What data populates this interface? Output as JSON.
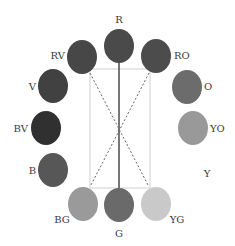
{
  "diagram": {
    "frame": {
      "x": 90,
      "y": 69,
      "w": 60,
      "h": 119,
      "stroke": "#d0d0d0"
    },
    "lines": [
      {
        "name": "solid-r-g",
        "x1": 119,
        "y1": 62,
        "x2": 119,
        "y2": 190,
        "style": "solid"
      },
      {
        "name": "dashed-rv-yg",
        "x1": 90,
        "y1": 73,
        "x2": 148,
        "y2": 185,
        "style": "dashed"
      },
      {
        "name": "dashed-ro-bg",
        "x1": 149,
        "y1": 73,
        "x2": 91,
        "y2": 185,
        "style": "dashed"
      }
    ],
    "nodes": [
      {
        "id": "R",
        "label": "R",
        "cx": 119,
        "cy": 46,
        "color": "#4a4a4a",
        "lx": 119,
        "ly": 23,
        "anchor": "middle"
      },
      {
        "id": "RV",
        "label": "RV",
        "cx": 82,
        "cy": 57,
        "color": "#474747",
        "lx": 65,
        "ly": 59,
        "anchor": "end"
      },
      {
        "id": "RO",
        "label": "RO",
        "cx": 156,
        "cy": 56,
        "color": "#4c4c4c",
        "lx": 174,
        "ly": 59,
        "anchor": "start"
      },
      {
        "id": "V",
        "label": "V",
        "cx": 53,
        "cy": 86,
        "color": "#414141",
        "lx": 36,
        "ly": 90,
        "anchor": "end"
      },
      {
        "id": "O",
        "label": "O",
        "cx": 187,
        "cy": 87,
        "color": "#6c6c6c",
        "lx": 204,
        "ly": 90,
        "anchor": "start"
      },
      {
        "id": "BV",
        "label": "BV",
        "cx": 46,
        "cy": 128,
        "color": "#303030",
        "lx": 28,
        "ly": 132,
        "anchor": "end"
      },
      {
        "id": "YO",
        "label": "YO",
        "cx": 193,
        "cy": 128,
        "color": "#999999",
        "lx": 210,
        "ly": 132,
        "anchor": "start"
      },
      {
        "id": "B",
        "label": "B",
        "cx": 53,
        "cy": 170,
        "color": "#575757",
        "lx": 36,
        "ly": 174,
        "anchor": "end"
      },
      {
        "id": "Y",
        "label": "Y",
        "cx": null,
        "cy": null,
        "color": null,
        "lx": 207,
        "ly": 177,
        "anchor": "middle"
      },
      {
        "id": "BG",
        "label": "BG",
        "cx": 83,
        "cy": 204,
        "color": "#9a9a9a",
        "lx": 62,
        "ly": 223,
        "anchor": "middle"
      },
      {
        "id": "G",
        "label": "G",
        "cx": 119,
        "cy": 205,
        "color": "#6a6a6a",
        "lx": 119,
        "ly": 237,
        "anchor": "middle"
      },
      {
        "id": "YG",
        "label": "YG",
        "cx": 156,
        "cy": 204,
        "color": "#c9c9c9",
        "lx": 177,
        "ly": 223,
        "anchor": "middle"
      }
    ]
  }
}
